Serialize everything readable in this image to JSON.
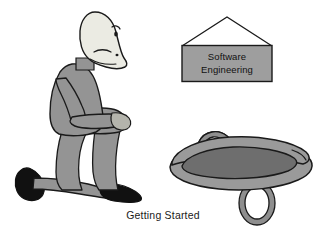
{
  "scene": {
    "title": "Getting Started",
    "background_color": "#ffffff",
    "caption": {
      "text": "Getting Started",
      "x": 163,
      "y": 219,
      "color": "#1a1a1a"
    },
    "sign": {
      "line1": "Software",
      "line2": "Engineering",
      "panel_fill": "#9e9e9e",
      "panel_stroke": "#1a1a1a",
      "roof_stroke": "#1a1a1a",
      "text_color": "#111111",
      "panel": {
        "x": 182,
        "y": 45,
        "width": 90,
        "height": 36
      },
      "roof_apex": {
        "x": 227,
        "y": 17
      }
    },
    "person": {
      "label": "kneeling-person",
      "pose": "kneeling",
      "skin_fill": "#ebebe3",
      "clothing_fill": "#949494",
      "shoe_fill": "#111111",
      "outline": "#1a1a1a"
    },
    "object": {
      "label": "boulder-with-handles",
      "rim_fill": "#9a9a9a",
      "basin_fill": "#6e6e6e",
      "handle_fill": "#8e8e8e",
      "outline": "#1a1a1a",
      "handle_count": 2
    }
  },
  "colors": {
    "ink": "#1a1a1a",
    "light_gray": "#ebebe3",
    "mid_gray": "#949494",
    "dark_gray": "#6e6e6e",
    "black": "#111111",
    "white": "#ffffff"
  }
}
